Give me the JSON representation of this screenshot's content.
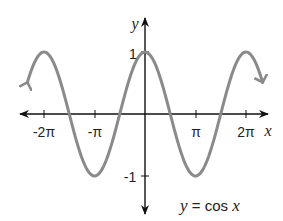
{
  "chart_data": {
    "type": "line",
    "title": "",
    "function": "y = cos x",
    "xlabel": "x",
    "ylabel": "y",
    "x_tick_labels": [
      "-2π",
      "-π",
      "π",
      "2π"
    ],
    "x_tick_values": [
      -6.2832,
      -3.1416,
      3.1416,
      6.2832
    ],
    "y_tick_labels": [
      "1",
      "-1"
    ],
    "y_tick_values": [
      1,
      -1
    ],
    "xlim": [
      -2.5,
      2.5
    ],
    "xlim_note": "domain shown approx -2.35π to 2.35π, arrows on both ends",
    "ylim": [
      -1.6,
      1.6
    ],
    "grid": false,
    "series": [
      {
        "name": "y = cos x",
        "color": "#8a8a8a",
        "x": [
          -7.33,
          -6.2832,
          -4.7124,
          -3.1416,
          -1.5708,
          0,
          1.5708,
          3.1416,
          4.7124,
          6.2832,
          7.33
        ],
        "values": [
          0.5,
          1,
          0,
          -1,
          0,
          1,
          0,
          -1,
          0,
          1,
          0.5
        ]
      }
    ],
    "annotations": [
      {
        "text": "y = cos x",
        "position": "bottom-right"
      }
    ]
  },
  "labels": {
    "x_axis": "x",
    "y_axis": "y",
    "tick_neg2pi": "-2π",
    "tick_negpi": "-π",
    "tick_pi": "π",
    "tick_2pi": "2π",
    "tick_y1": "1",
    "tick_yneg1": "-1",
    "eq_y": "y",
    "eq_mid": " = cos ",
    "eq_x": "x"
  },
  "colors": {
    "curve": "#8a8a8a",
    "axis": "#111111"
  }
}
